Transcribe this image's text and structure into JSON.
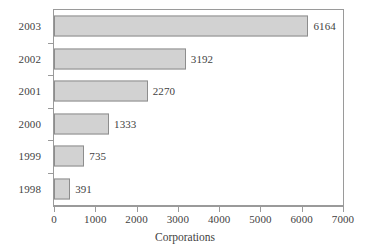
{
  "chart_data": {
    "type": "bar",
    "orientation": "horizontal",
    "title": "",
    "subtitle": "",
    "xlabel": "Corporations",
    "ylabel": "",
    "categories": [
      "2003",
      "2002",
      "2001",
      "2000",
      "1999",
      "1998"
    ],
    "values": [
      6164,
      3192,
      2270,
      1333,
      735,
      391
    ],
    "data_labels": [
      "6164",
      "3192",
      "2270",
      "1333",
      "735",
      "391"
    ],
    "xlim": [
      0,
      7000
    ],
    "xticks": [
      0,
      1000,
      2000,
      3000,
      4000,
      5000,
      6000,
      7000
    ],
    "xtick_labels": [
      "0",
      "1000",
      "2000",
      "3000",
      "4000",
      "5000",
      "6000",
      "7000"
    ],
    "grid": false,
    "legend": null,
    "legend_position": "none",
    "series": [
      {
        "name": "Corporations",
        "values": [
          6164,
          3192,
          2270,
          1333,
          735,
          391
        ]
      }
    ]
  },
  "style": {
    "bar_fill": "#d2d2d2",
    "bar_border": "#8d8d8d",
    "axis_color": "#9a9a9a",
    "text_color": "#3f3f3f",
    "background": "#ffffff"
  }
}
